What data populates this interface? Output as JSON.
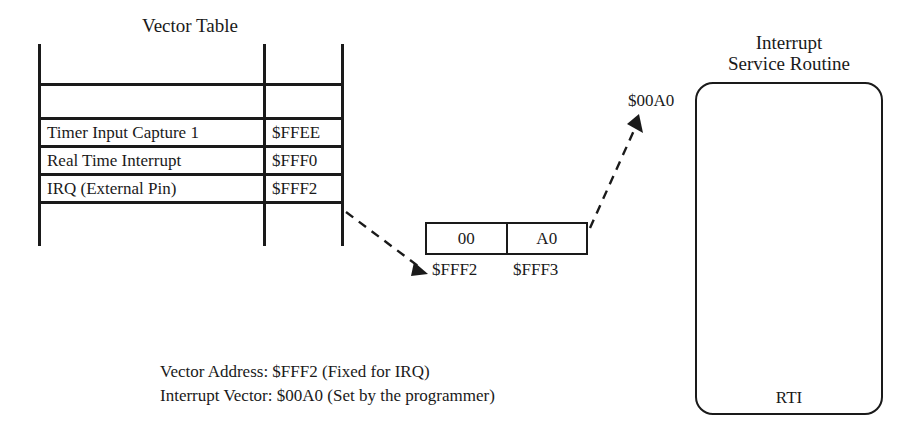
{
  "vector_table": {
    "title": "Vector Table",
    "rows": [
      {
        "name": "Timer Input Capture 1",
        "address": "$FFEE"
      },
      {
        "name": "Real Time Interrupt",
        "address": "$FFF0"
      },
      {
        "name": "IRQ (External Pin)",
        "address": "$FFF2"
      }
    ]
  },
  "memory": {
    "cells": [
      {
        "value": "00",
        "address": "$FFF2"
      },
      {
        "value": "A0",
        "address": "$FFF3"
      }
    ]
  },
  "isr": {
    "title": "Interrupt\nService Routine",
    "title_line_1": "Interrupt",
    "title_line_2": "Service Routine",
    "entry_vector": "$00A0",
    "return_instruction": "RTI"
  },
  "caption": {
    "line_1": "Vector Address: $FFF2 (Fixed for IRQ)",
    "line_2": "Interrupt Vector: $00A0 (Set by the programmer)"
  },
  "colors": {
    "ink": "#1a1a1a",
    "background": "#ffffff"
  }
}
